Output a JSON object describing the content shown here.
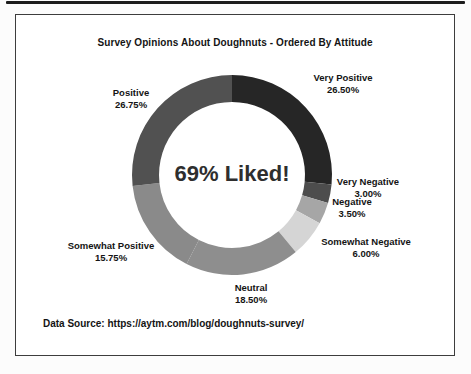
{
  "title": "Survey Opinions About Doughnuts - Ordered By Attitude",
  "data_source": "Data Source: https://aytm.com/blog/doughnuts-survey/",
  "chart_data": {
    "type": "pie",
    "subtype": "donut",
    "title": "Survey Opinions About Doughnuts - Ordered By Attitude",
    "center_text": "69% Liked!",
    "start_angle_deg": 0,
    "direction": "clockwise",
    "inner_radius_ratio": 0.73,
    "legend_position": "labels-outside",
    "segments": [
      {
        "label": "Very Positive",
        "value": 26.5,
        "display": "26.50%",
        "color": "#262626"
      },
      {
        "label": "Very Negative",
        "value": 3.0,
        "display": "3.00%",
        "color": "#4d4d4d"
      },
      {
        "label": "Negative",
        "value": 3.5,
        "display": "3.50%",
        "color": "#a6a6a6"
      },
      {
        "label": "Somewhat Negative",
        "value": 6.0,
        "display": "6.00%",
        "color": "#d5d5d5"
      },
      {
        "label": "Neutral",
        "value": 18.5,
        "display": "18.50%",
        "color": "#8e8e8e"
      },
      {
        "label": "Somewhat Positive",
        "value": 15.75,
        "display": "15.75%",
        "color": "#8a8a8a"
      },
      {
        "label": "Positive",
        "value": 26.75,
        "display": "26.75%",
        "color": "#515151"
      }
    ]
  }
}
